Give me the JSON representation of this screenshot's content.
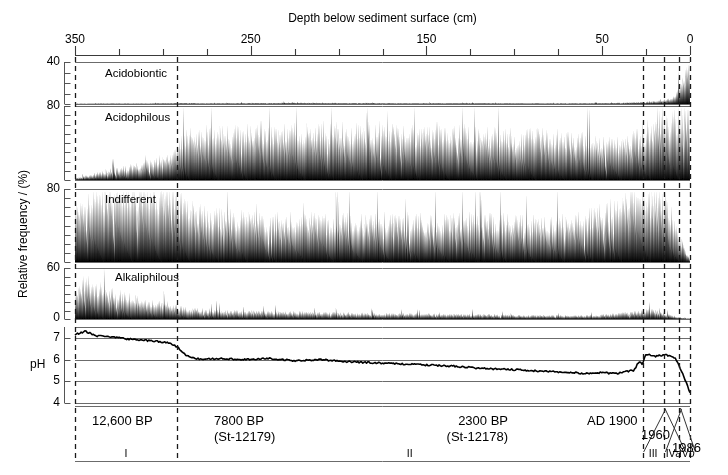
{
  "figure": {
    "top_axis_title": "Depth below sediment surface (cm)",
    "y_axis_title": "Relative frequency / (%)",
    "ph_axis_label": "pH"
  },
  "axes": {
    "x": {
      "label": "Depth below sediment surface (cm)",
      "unit": "cm",
      "reversed": true,
      "min": 0,
      "max": 350,
      "major_ticks": [
        350,
        250,
        150,
        50,
        0
      ],
      "major_tick_labels": [
        "350",
        "250",
        "150",
        "50",
        "0"
      ],
      "minor_tick_interval": 25,
      "minor_ticks": [
        350,
        325,
        300,
        275,
        250,
        225,
        200,
        175,
        150,
        125,
        100,
        75,
        50,
        25,
        0
      ]
    },
    "y_panels": [
      {
        "name": "Acidobiontic",
        "max": 40,
        "min": 0,
        "labeled_ticks": [
          "40"
        ],
        "minor_tick_interval": 10
      },
      {
        "name": "Acidophilous",
        "max": 80,
        "min": 0,
        "labeled_ticks": [
          "80"
        ],
        "minor_tick_interval": 10
      },
      {
        "name": "Indifferent",
        "max": 80,
        "min": 0,
        "labeled_ticks": [
          "80"
        ],
        "minor_tick_interval": 10
      },
      {
        "name": "Alkaliphilous",
        "max": 60,
        "min": 0,
        "labeled_ticks": [
          "60",
          "0"
        ],
        "minor_tick_interval": 10
      },
      {
        "name": "pH",
        "max": 7.5,
        "min": 4,
        "labeled_ticks": [
          "7",
          "6",
          "5",
          "4"
        ],
        "minor_tick_interval": 1
      }
    ]
  },
  "zone_boundaries_cm": [
    292,
    27,
    15,
    6
  ],
  "zones": [
    {
      "label": "I",
      "start_cm": 350,
      "end_cm": 292
    },
    {
      "label": "II",
      "start_cm": 292,
      "end_cm": 27
    },
    {
      "label": "III",
      "start_cm": 27,
      "end_cm": 15
    },
    {
      "label": "IVa",
      "start_cm": 15,
      "end_cm": 6,
      "italic_suffix": "a"
    },
    {
      "label": "IVb",
      "start_cm": 6,
      "end_cm": 0,
      "italic_suffix": "b"
    }
  ],
  "date_markers": [
    {
      "text": "12,600 BP",
      "sublabel": "",
      "at_cm": 330
    },
    {
      "text": "7800 BP",
      "sublabel": "(St-12179)",
      "at_cm": 288
    },
    {
      "text": "2300 BP",
      "sublabel": "(St-12178)",
      "at_cm": 32
    },
    {
      "text": "AD 1900",
      "sublabel": "",
      "at_cm": 22
    },
    {
      "text": "1960",
      "sublabel": "",
      "at_cm": 13
    },
    {
      "text": "1986",
      "sublabel": "",
      "at_cm": 4
    }
  ],
  "colors": {
    "ink": "#000000",
    "background": "#ffffff",
    "axis": "#6b6b6b",
    "dashed": "#1a1a1a"
  },
  "chart_data": {
    "type": "area",
    "xlabel": "Depth below sediment surface (cm)",
    "ylabel": "Relative frequency / (%)",
    "xlim": [
      350,
      0
    ],
    "grid": false,
    "legend": "none",
    "note": "Values are sampled at ~1 cm resolution; arrays below give representative anchor values (depth_cm -> percent) used to render each silhouette.",
    "series": [
      {
        "name": "Acidobiontic",
        "panel": 0,
        "ylim": [
          0,
          40
        ],
        "anchors_depth_cm": [
          350,
          330,
          310,
          292,
          270,
          250,
          220,
          190,
          160,
          130,
          100,
          70,
          50,
          40,
          30,
          27,
          20,
          15,
          12,
          8,
          5,
          3,
          1,
          0
        ],
        "anchors_percent": [
          0.3,
          0.6,
          0.5,
          1.0,
          0.8,
          0.9,
          1.1,
          1.0,
          0.8,
          0.9,
          0.8,
          0.7,
          0.9,
          1.2,
          1.6,
          2.0,
          2.6,
          3.4,
          5.0,
          9.0,
          17.0,
          26.0,
          34.0,
          38.0
        ]
      },
      {
        "name": "Acidophilous",
        "panel": 1,
        "ylim": [
          0,
          80
        ],
        "anchors_depth_cm": [
          350,
          340,
          330,
          320,
          310,
          300,
          292,
          285,
          275,
          265,
          255,
          245,
          235,
          220,
          205,
          190,
          175,
          160,
          145,
          130,
          115,
          100,
          85,
          70,
          55,
          45,
          35,
          30,
          27,
          22,
          18,
          15,
          12,
          9,
          6,
          3,
          1,
          0
        ],
        "anchors_percent": [
          2,
          6,
          10,
          13,
          17,
          22,
          34,
          46,
          50,
          52,
          50,
          52,
          48,
          50,
          52,
          49,
          51,
          47,
          50,
          48,
          47,
          45,
          46,
          44,
          40,
          38,
          40,
          44,
          48,
          55,
          60,
          64,
          62,
          60,
          63,
          66,
          70,
          72
        ]
      },
      {
        "name": "Indifferent",
        "panel": 2,
        "ylim": [
          0,
          80
        ],
        "anchors_depth_cm": [
          350,
          340,
          330,
          320,
          310,
          300,
          292,
          285,
          275,
          260,
          245,
          230,
          215,
          200,
          185,
          170,
          155,
          140,
          125,
          110,
          95,
          80,
          65,
          55,
          45,
          38,
          32,
          27,
          22,
          18,
          15,
          12,
          9,
          6,
          4,
          2,
          0
        ],
        "anchors_percent": [
          62,
          70,
          72,
          70,
          73,
          71,
          66,
          54,
          48,
          46,
          44,
          45,
          43,
          44,
          42,
          44,
          43,
          42,
          44,
          43,
          42,
          41,
          44,
          48,
          56,
          62,
          66,
          68,
          64,
          66,
          62,
          54,
          42,
          30,
          20,
          10,
          2
        ]
      },
      {
        "name": "Alkaliphilous",
        "panel": 3,
        "ylim": [
          0,
          60
        ],
        "anchors_depth_cm": [
          350,
          344,
          338,
          330,
          322,
          314,
          305,
          296,
          292,
          285,
          275,
          260,
          245,
          230,
          215,
          200,
          185,
          170,
          155,
          140,
          125,
          110,
          95,
          80,
          65,
          55,
          48,
          42,
          36,
          30,
          27,
          22,
          18,
          14,
          10,
          6,
          3,
          0
        ],
        "anchors_percent": [
          30,
          42,
          36,
          30,
          26,
          22,
          19,
          16,
          14,
          11,
          10,
          9,
          8,
          8,
          7,
          7,
          6,
          6,
          6,
          5,
          5,
          5,
          4,
          4,
          4,
          4,
          5,
          6,
          7,
          8,
          9,
          10,
          8,
          6,
          4,
          2,
          1,
          0.5
        ]
      },
      {
        "name": "pH",
        "panel": 4,
        "type": "line",
        "ylim": [
          4,
          7.5
        ],
        "anchors_depth_cm": [
          350,
          344,
          338,
          332,
          326,
          320,
          312,
          305,
          298,
          292,
          286,
          278,
          268,
          255,
          240,
          225,
          210,
          195,
          180,
          165,
          150,
          135,
          120,
          105,
          92,
          80,
          68,
          58,
          50,
          42,
          36,
          32,
          29,
          27,
          25,
          22,
          19,
          16,
          15,
          13,
          11,
          9,
          7,
          5,
          3,
          1,
          0
        ],
        "anchors_value": [
          7.15,
          7.3,
          7.1,
          7.05,
          7.0,
          6.95,
          6.9,
          6.85,
          6.8,
          6.6,
          6.15,
          6.0,
          6.05,
          6.0,
          6.05,
          5.95,
          6.0,
          5.9,
          5.85,
          5.8,
          5.75,
          5.7,
          5.6,
          5.55,
          5.5,
          5.45,
          5.4,
          5.35,
          5.4,
          5.35,
          5.45,
          5.5,
          5.9,
          5.8,
          6.25,
          6.2,
          6.15,
          6.2,
          6.2,
          6.2,
          6.15,
          6.1,
          5.9,
          5.5,
          5.1,
          4.7,
          4.5
        ]
      }
    ]
  }
}
